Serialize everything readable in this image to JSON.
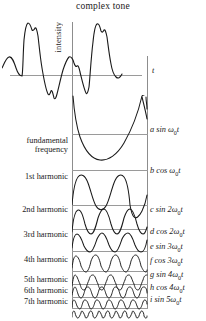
{
  "figure": {
    "title": "complex tone",
    "axis": {
      "y_label": "intensity",
      "x_label": "t"
    }
  },
  "rows": [
    {
      "left_label": "",
      "formula": "",
      "name": "complex-tone-waveform"
    },
    {
      "left_label_line1": "fundamental",
      "left_label_line2": "frequency",
      "formula_coef": "a",
      "formula_fn": "sin",
      "formula_omega": "ω",
      "formula_sub": "0",
      "formula_mult": "",
      "formula_var": "t",
      "name": "fundamental-frequency"
    },
    {
      "left_label": "1st harmonic",
      "formula_coef": "b",
      "formula_fn": "cos",
      "formula_omega": "ω",
      "formula_sub": "0",
      "formula_mult": "",
      "formula_var": "t",
      "name": "harmonic-1"
    },
    {
      "left_label": "2nd harmonic",
      "formula_coef": "c",
      "formula_fn": "sin",
      "formula_omega": "ω",
      "formula_sub": "0",
      "formula_mult": "2",
      "formula_var": "t",
      "name": "harmonic-2"
    },
    {
      "left_label": "3rd harmonic",
      "formula_coef": "d",
      "formula_fn": "cos",
      "formula_omega": "ω",
      "formula_sub": "0",
      "formula_mult": "2",
      "formula_var": "t",
      "name": "harmonic-3"
    },
    {
      "left_label": "",
      "formula_coef": "e",
      "formula_fn": "sin",
      "formula_omega": "ω",
      "formula_sub": "0",
      "formula_mult": "3",
      "formula_var": "t",
      "name": "harmonic-3b"
    },
    {
      "left_label": "4th harmonic",
      "formula_coef": "f",
      "formula_fn": "cos",
      "formula_omega": "ω",
      "formula_sub": "0",
      "formula_mult": "3",
      "formula_var": "t",
      "name": "harmonic-4"
    },
    {
      "left_label": "",
      "formula_coef": "g",
      "formula_fn": "sin",
      "formula_omega": "ω",
      "formula_sub": "0",
      "formula_mult": "4",
      "formula_var": "t",
      "name": "harmonic-4b"
    },
    {
      "left_label": "5th harmonic",
      "formula_coef": "h",
      "formula_fn": "cos",
      "formula_omega": "ω",
      "formula_sub": "0",
      "formula_mult": "4",
      "formula_var": "t",
      "name": "harmonic-5"
    },
    {
      "left_label": "6th harmonic",
      "formula_coef": "i",
      "formula_fn": "sin",
      "formula_omega": "ω",
      "formula_sub": "0",
      "formula_mult": "5",
      "formula_var": "t",
      "name": "harmonic-6"
    },
    {
      "left_label": "7th harmonic",
      "formula": "",
      "name": "harmonic-7"
    }
  ],
  "labels": {
    "fundamental_l1": "fundamental",
    "fundamental_l2": "frequency",
    "h1": "1st harmonic",
    "h2": "2nd harmonic",
    "h3": "3rd harmonic",
    "h4": "4th harmonic",
    "h5": "5th harmonic",
    "h6": "6th harmonic",
    "h7": "7th harmonic"
  },
  "chart_data": {
    "type": "line",
    "title": "complex tone",
    "xlabel": "t",
    "ylabel": "intensity",
    "grid": false,
    "legend": "none",
    "series": [
      {
        "name": "complex tone",
        "role": "sum",
        "formula": "",
        "cycles": 2
      },
      {
        "name": "fundamental frequency",
        "formula": "a sin ω0 t",
        "coefficient": "a",
        "function": "sin",
        "harmonic_multiple": 1,
        "cycles": 1
      },
      {
        "name": "1st harmonic",
        "formula": "b cos ω0 t",
        "coefficient": "b",
        "function": "cos",
        "harmonic_multiple": 1,
        "cycles": 1
      },
      {
        "name": "2nd harmonic",
        "formula": "c sin 2ω0 t",
        "coefficient": "c",
        "function": "sin",
        "harmonic_multiple": 2,
        "cycles": 3
      },
      {
        "name": "3rd harmonic",
        "formula": "d cos 2ω0 t",
        "coefficient": "d",
        "function": "cos",
        "harmonic_multiple": 2,
        "cycles": 3
      },
      {
        "name": "",
        "formula": "e sin 3ω0 t",
        "coefficient": "e",
        "function": "sin",
        "harmonic_multiple": 3,
        "cycles": 4
      },
      {
        "name": "4th harmonic",
        "formula": "f cos 3ω0 t",
        "coefficient": "f",
        "function": "cos",
        "harmonic_multiple": 3,
        "cycles": 5
      },
      {
        "name": "",
        "formula": "g sin 4ω0 t",
        "coefficient": "g",
        "function": "sin",
        "harmonic_multiple": 4,
        "cycles": 6
      },
      {
        "name": "5th harmonic",
        "formula": "h cos 4ω0 t",
        "coefficient": "h",
        "function": "cos",
        "harmonic_multiple": 4,
        "cycles": 8
      },
      {
        "name": "6th harmonic",
        "formula": "i sin 5ω0 t",
        "coefficient": "i",
        "function": "sin",
        "harmonic_multiple": 5,
        "cycles": 10
      },
      {
        "name": "7th harmonic",
        "formula": "",
        "harmonic_multiple": 6,
        "cycles": 10
      }
    ]
  }
}
